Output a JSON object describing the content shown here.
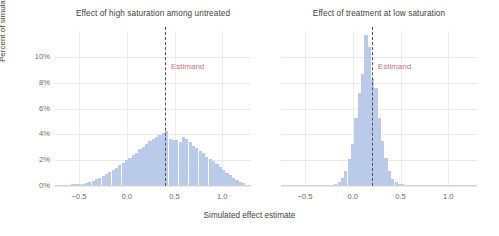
{
  "chart_data": {
    "type": "bar",
    "title": "",
    "xlabel": "Simulated effect estimate",
    "ylabel": "Percent of simulations",
    "xlim": [
      -0.75,
      1.3
    ],
    "ylim": [
      0,
      12
    ],
    "grid": true,
    "legend": "none",
    "y_ticks": [
      "0%",
      "2%",
      "4%",
      "6%",
      "8%",
      "10%"
    ],
    "y_tick_values": [
      0,
      2,
      4,
      6,
      8,
      10
    ],
    "x_ticks": [
      "−0.5",
      "0.0",
      "0.5",
      "1.0"
    ],
    "x_tick_values": [
      -0.5,
      0.0,
      0.5,
      1.0
    ],
    "annotation_label": "Estimand",
    "colors": {
      "bar": "#b9cbe9",
      "estimand_line": "#4e4d6b",
      "estimand_text": "#c07680",
      "grid": "#e9e9ec",
      "axis": "#d2d2d6",
      "text": "#3f3f3f",
      "tick_text": "#6b6b6b"
    },
    "panels": [
      {
        "title": "Effect of high saturation among untreated",
        "estimand": 0.4,
        "bin_width": 0.035,
        "x": [
          -0.56,
          -0.525,
          -0.49,
          -0.455,
          -0.42,
          -0.385,
          -0.35,
          -0.315,
          -0.28,
          -0.245,
          -0.21,
          -0.175,
          -0.14,
          -0.105,
          -0.07,
          -0.035,
          0.0,
          0.035,
          0.07,
          0.105,
          0.14,
          0.175,
          0.21,
          0.245,
          0.28,
          0.315,
          0.35,
          0.385,
          0.42,
          0.455,
          0.49,
          0.525,
          0.56,
          0.595,
          0.63,
          0.665,
          0.7,
          0.735,
          0.77,
          0.805,
          0.84,
          0.875,
          0.91,
          0.945,
          0.98,
          1.015,
          1.05,
          1.085,
          1.12,
          1.155,
          1.19,
          1.225
        ],
        "values": [
          0.05,
          0.05,
          0.08,
          0.1,
          0.15,
          0.2,
          0.3,
          0.45,
          0.55,
          0.7,
          0.85,
          1.0,
          1.2,
          1.35,
          1.55,
          1.7,
          1.9,
          2.1,
          2.35,
          2.5,
          2.8,
          2.95,
          3.15,
          3.4,
          3.55,
          3.75,
          3.9,
          4.0,
          4.15,
          3.55,
          3.5,
          3.45,
          3.35,
          3.7,
          3.55,
          3.3,
          3.05,
          2.9,
          2.6,
          2.45,
          2.2,
          2.05,
          1.85,
          1.6,
          1.4,
          1.15,
          0.95,
          0.75,
          0.55,
          0.4,
          0.25,
          0.12
        ]
      },
      {
        "title": "Effect of treatment at low saturation",
        "estimand": 0.2,
        "bin_width": 0.035,
        "x": [
          -0.175,
          -0.14,
          -0.105,
          -0.07,
          -0.035,
          0.0,
          0.035,
          0.07,
          0.105,
          0.14,
          0.175,
          0.21,
          0.245,
          0.28,
          0.315,
          0.35,
          0.385,
          0.42,
          0.455,
          0.49,
          0.525
        ],
        "values": [
          0.1,
          0.2,
          0.55,
          1.05,
          2.0,
          3.2,
          5.2,
          7.1,
          8.6,
          11.6,
          10.7,
          8.2,
          7.5,
          5.2,
          3.4,
          2.1,
          1.1,
          0.45,
          0.2,
          0.08,
          0.05
        ]
      }
    ]
  }
}
